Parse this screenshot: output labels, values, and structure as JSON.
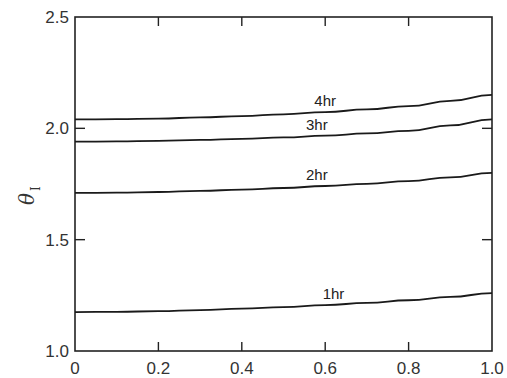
{
  "chart_data": {
    "type": "line",
    "title": "",
    "xlabel": "",
    "ylabel": "θ_I",
    "ylabel_symbol": "θ",
    "ylabel_subscript": "I",
    "xlim": [
      0,
      1.0
    ],
    "ylim": [
      1.0,
      2.5
    ],
    "x_ticks": [
      "0",
      "0.2",
      "0.4",
      "0.6",
      "0.8",
      "1.0"
    ],
    "x_tick_values": [
      0,
      0.2,
      0.4,
      0.6,
      0.8,
      1.0
    ],
    "y_ticks": [
      "1.0",
      "1.5",
      "2.0",
      "2.5"
    ],
    "y_tick_values": [
      1.0,
      1.5,
      2.0,
      2.5
    ],
    "grid": false,
    "legend": "inline labels",
    "x": [
      0,
      0.1,
      0.2,
      0.3,
      0.4,
      0.5,
      0.6,
      0.7,
      0.8,
      0.9,
      1.0
    ],
    "series": [
      {
        "name": "1hr",
        "label": "1hr",
        "label_x": 0.62,
        "values": [
          1.175,
          1.176,
          1.179,
          1.184,
          1.19,
          1.197,
          1.206,
          1.216,
          1.228,
          1.243,
          1.26
        ]
      },
      {
        "name": "2hr",
        "label": "2hr",
        "label_x": 0.58,
        "values": [
          1.71,
          1.711,
          1.714,
          1.719,
          1.725,
          1.732,
          1.741,
          1.751,
          1.763,
          1.78,
          1.8
        ]
      },
      {
        "name": "3hr",
        "label": "3hr",
        "label_x": 0.58,
        "values": [
          1.94,
          1.941,
          1.944,
          1.948,
          1.953,
          1.959,
          1.967,
          1.977,
          1.989,
          2.013,
          2.04
        ]
      },
      {
        "name": "4hr",
        "label": "4hr",
        "label_x": 0.6,
        "values": [
          2.04,
          2.041,
          2.044,
          2.049,
          2.055,
          2.063,
          2.073,
          2.085,
          2.1,
          2.123,
          2.15
        ]
      }
    ]
  },
  "colors": {
    "line": "#1a1a1a",
    "axis": "#222222",
    "text": "#333333",
    "background": "#ffffff"
  }
}
